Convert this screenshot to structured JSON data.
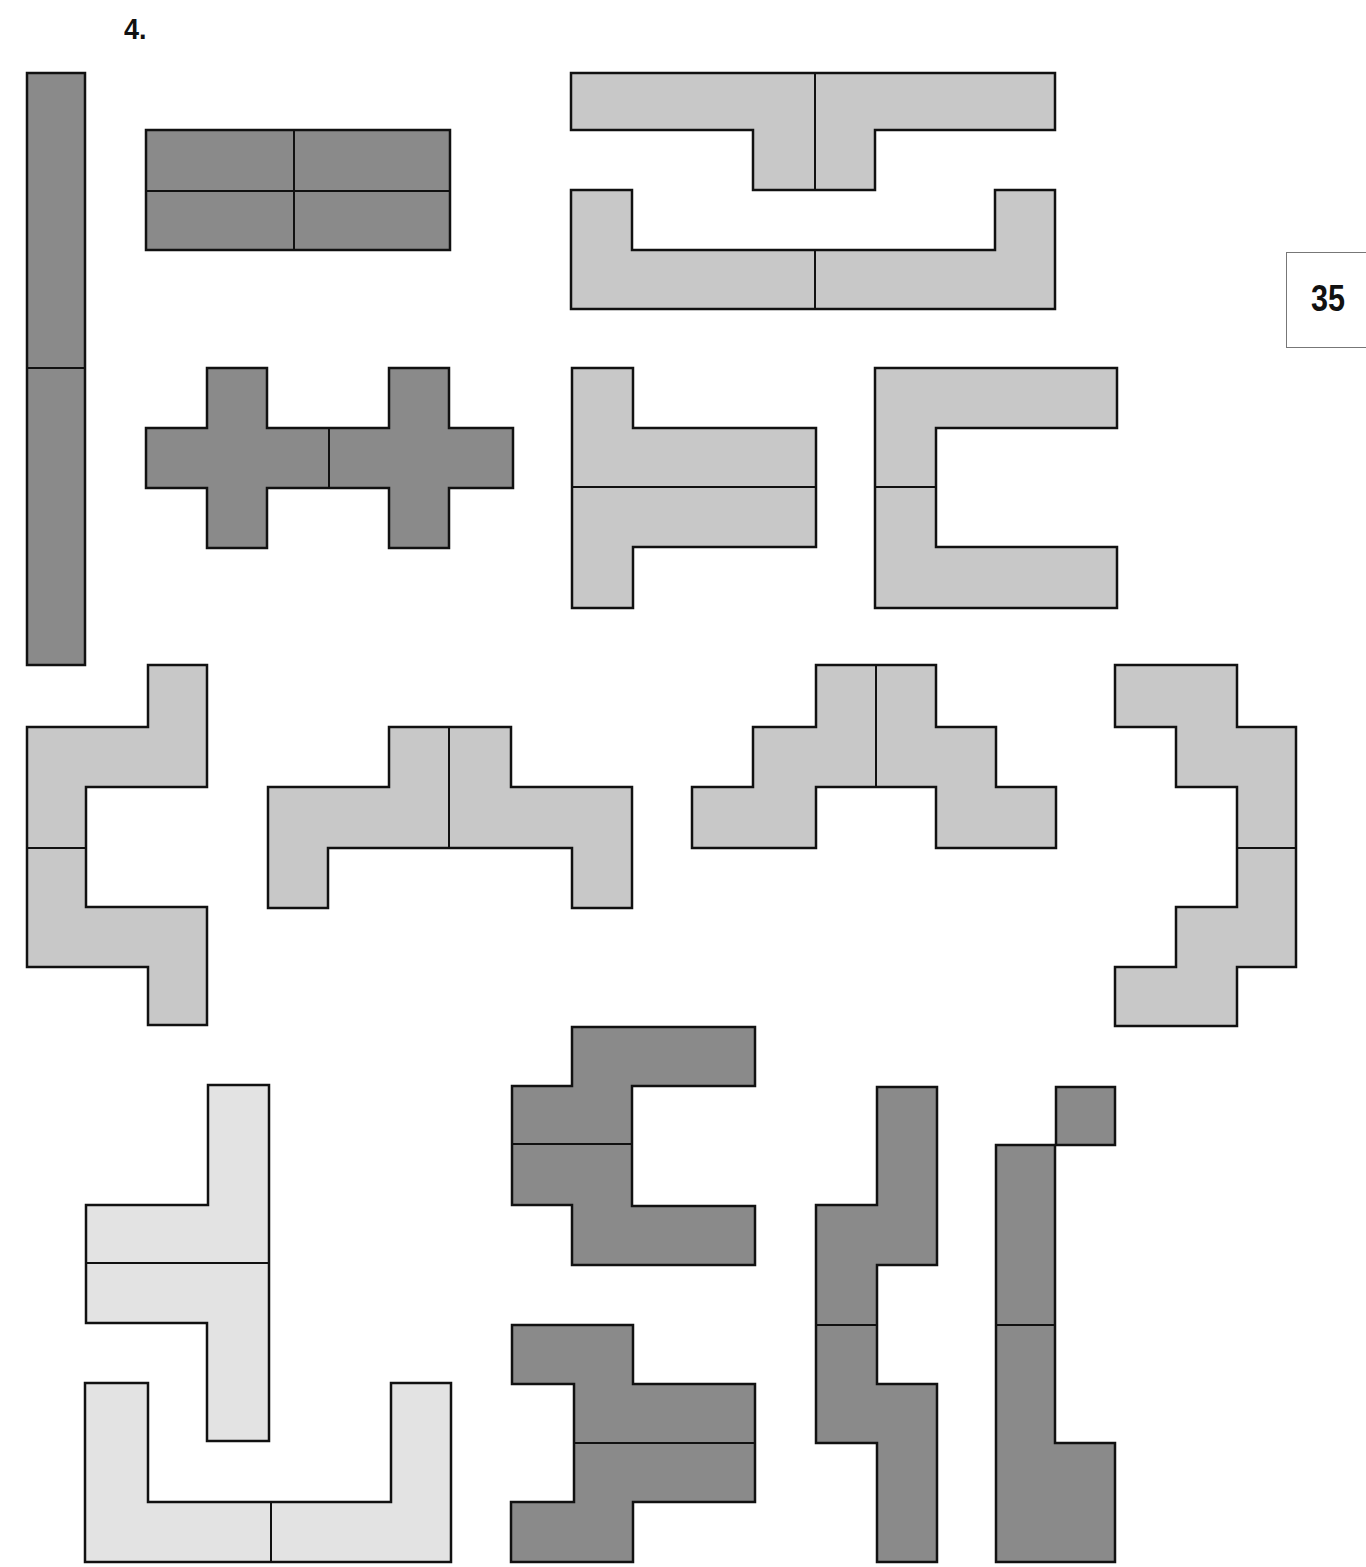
{
  "title": "4.",
  "page_number": "35",
  "colors": {
    "dark": "#8a8a8a",
    "medium": "#c8c8c8",
    "light": "#e3e3e3",
    "stroke": "#111111"
  },
  "shapes": [
    {
      "id": "bar-vertical",
      "fill": "dark",
      "points": "27,73 85,73 85,665 27,665",
      "lines": [
        [
          27,
          368,
          85,
          368
        ]
      ]
    },
    {
      "id": "rect-2x2",
      "fill": "dark",
      "points": "146,130 450,130 450,250 146,250",
      "lines": [
        [
          294,
          130,
          294,
          250
        ],
        [
          146,
          191,
          450,
          191
        ]
      ]
    },
    {
      "id": "double-cross",
      "fill": "dark",
      "points": "207,368 267,368 267,428 389,428 389,368 449,368 449,428 513,428 513,488 449,488 449,548 389,548 389,488 267,488 267,548 207,548 207,488 146,488 146,428 207,428",
      "lines": [
        [
          329,
          428,
          329,
          488
        ]
      ]
    },
    {
      "id": "t-top",
      "fill": "medium",
      "points": "571,73 1055,73 1055,130 875,130 875,190 753,190 753,130 571,130",
      "lines": [
        [
          815,
          73,
          815,
          190
        ]
      ]
    },
    {
      "id": "u-open",
      "fill": "medium",
      "points": "571,190 632,190 632,250 995,250 995,190 1055,190 1055,309 571,309",
      "lines": [
        [
          815,
          250,
          815,
          309
        ]
      ]
    },
    {
      "id": "h-shape",
      "fill": "medium",
      "points": "572,368 633,368 633,428 816,428 816,547 633,547 633,608 572,608",
      "lines": [
        [
          572,
          487,
          816,
          487
        ]
      ]
    },
    {
      "id": "c-shape",
      "fill": "medium",
      "points": "875,368 1117,368 1117,428 936,428 936,547 1117,547 1117,608 875,608",
      "lines": [
        [
          875,
          487,
          936,
          487
        ]
      ]
    },
    {
      "id": "s-left",
      "fill": "medium",
      "points": "148,665 207,665 207,787 86,787 86,907 207,907 207,1025 148,1025 148,967 27,967 27,727 148,727",
      "lines": [
        [
          27,
          848,
          86,
          848
        ]
      ]
    },
    {
      "id": "step-u",
      "fill": "medium",
      "points": "389,727 511,727 511,787 632,787 632,908 572,908 572,848 328,848 328,908 268,908 268,787 389,787",
      "lines": [
        [
          449,
          727,
          449,
          848
        ]
      ]
    },
    {
      "id": "stairs",
      "fill": "medium",
      "points": "816,665 936,665 936,727 996,727 996,787 1056,787 1056,848 936,848 936,787 816,787 816,848 692,848 692,787 753,787 753,727 816,727",
      "lines": [
        [
          876,
          665,
          876,
          787
        ]
      ]
    },
    {
      "id": "s-right",
      "fill": "medium",
      "points": "1115,665 1237,665 1237,727 1296,727 1296,967 1237,967 1237,1026 1115,1026 1115,967 1176,967 1176,907 1237,907 1237,787 1176,787 1176,727 1115,727",
      "lines": [
        [
          1237,
          848,
          1296,
          848
        ]
      ]
    },
    {
      "id": "light-t",
      "fill": "light",
      "points": "208,1085 269,1085 269,1441 207,1441 207,1323 86,1323 86,1205 208,1205",
      "lines": [
        [
          86,
          1263,
          269,
          1263
        ]
      ]
    },
    {
      "id": "light-u",
      "fill": "light",
      "points": "85,1383 148,1383 148,1502 391,1502 391,1383 451,1383 451,1562 85,1562",
      "lines": [
        [
          271,
          1502,
          271,
          1562
        ]
      ]
    },
    {
      "id": "dark-c",
      "fill": "dark",
      "points": "572,1027 755,1027 755,1086 632,1086 632,1206 755,1206 755,1265 572,1265 572,1205 512,1205 512,1086 572,1086",
      "lines": [
        [
          512,
          1144,
          632,
          1144
        ]
      ]
    },
    {
      "id": "dark-h",
      "fill": "dark",
      "points": "512,1325 633,1325 633,1384 755,1384 755,1502 633,1502 633,1562 511,1562 511,1502 574,1502 574,1384 512,1384",
      "lines": [
        [
          574,
          1443,
          755,
          1443
        ]
      ]
    },
    {
      "id": "dark-s1",
      "fill": "dark",
      "points": "877,1087 937,1087 937,1265 877,1265 877,1384 937,1384 937,1562 877,1562 877,1443 816,1443 816,1205 877,1205",
      "lines": [
        [
          816,
          1325,
          877,
          1325
        ]
      ]
    },
    {
      "id": "dark-s2",
      "fill": "dark",
      "points": "1056,1087 1115,1087 1115,1145 1055,1145 1055,1443 1115,1443 1115,1562 996,1562 996,1145 1056,1145",
      "lines": [
        [
          996,
          1325,
          1055,
          1325
        ]
      ]
    }
  ]
}
